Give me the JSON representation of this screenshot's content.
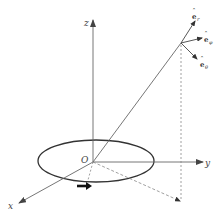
{
  "diagram": {
    "axes": {
      "x_label": "x",
      "y_label": "y",
      "z_label": "z",
      "origin_label": "O"
    },
    "vectors": [
      {
        "base": "e",
        "hat": "ˆ",
        "subscript": "r"
      },
      {
        "base": "e",
        "hat": "ˆ",
        "subscript": "φ"
      },
      {
        "base": "e",
        "hat": "ˆ",
        "subscript": "θ"
      }
    ],
    "colors": {
      "line": "#555555",
      "ellipse": "#333333",
      "dashed": "#777777",
      "text": "#444444"
    }
  }
}
